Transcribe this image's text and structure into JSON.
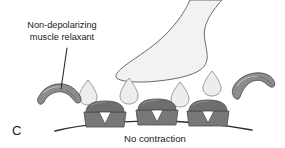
{
  "figure": {
    "panel_letter": "C",
    "annotation_label": {
      "line1": "Non-depolarizing",
      "line2": "muscle relaxant"
    },
    "caption": "No contraction",
    "elements": {
      "nerve_terminal_name": "nerve-terminal",
      "vesicle_name": "synaptic-vesicle",
      "receptor_name": "acetylcholine-receptor",
      "relaxant_name": "non-depolarizing-muscle-relaxant-molecule",
      "membrane_name": "muscle-membrane",
      "pointer_name": "annotation-pointer-line"
    },
    "colors": {
      "background": "#ffffff",
      "outline": "#4a4a4a",
      "nerve_fill": "#f2f2f2",
      "vesicle_fill": "#ededed",
      "receptor_fill": "#787878",
      "receptor_top_fill": "#6e6e6e",
      "receptor_shadow": "#9a9a9a",
      "relaxant_fill": "#8c8c8c",
      "relaxant_highlight": "#b5b5b5",
      "text": "#1a1a1a",
      "membrane_stroke": "#2b2b2b"
    },
    "counts": {
      "receptors": 3,
      "vesicles": 4,
      "relaxant_molecules": 2
    }
  }
}
